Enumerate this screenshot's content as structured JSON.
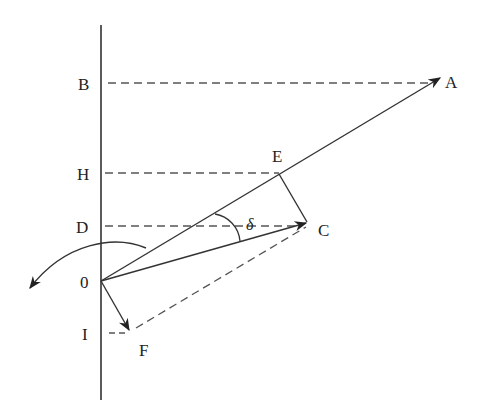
{
  "diagram": {
    "type": "vector-diagram",
    "axis": {
      "x": 101,
      "y1": 25,
      "y2": 400
    },
    "points": {
      "O": {
        "label": "0",
        "x": 101,
        "y": 281
      },
      "A": {
        "label": "A",
        "x": 442,
        "y": 77
      },
      "B": {
        "label": "B",
        "x": 101,
        "y": 83
      },
      "H": {
        "label": "H",
        "x": 101,
        "y": 173
      },
      "E": {
        "label": "E",
        "x": 279,
        "y": 173
      },
      "D": {
        "label": "D",
        "x": 101,
        "y": 226
      },
      "C": {
        "label": "C",
        "x": 308,
        "y": 222
      },
      "I": {
        "label": "I",
        "x": 101,
        "y": 333
      },
      "F": {
        "label": "F",
        "x": 130,
        "y": 332
      }
    },
    "angle_label": "δ",
    "labels": {
      "B": "B",
      "H": "H",
      "D": "D",
      "O": "0",
      "I": "I",
      "A": "A",
      "E": "E",
      "C": "C",
      "F": "F",
      "delta": "δ"
    },
    "colors": {
      "line": "#333333",
      "dash": "#555555"
    }
  }
}
